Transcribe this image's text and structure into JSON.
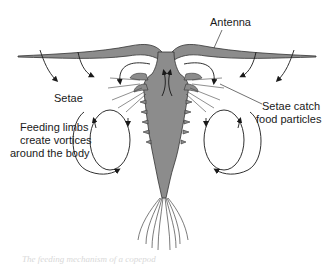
{
  "figure": {
    "labels": {
      "antenna": "Antenna",
      "setae": "Setae",
      "setae_catch": [
        "Setae catch",
        "food particles"
      ],
      "feeding_limbs": [
        "Feeding limbs",
        "create vortices",
        "around the body"
      ]
    },
    "bottom_caption_partial": "The feeding mechanism of a copepod",
    "colors": {
      "body_fill": "#8c8c8c",
      "outline": "#333333",
      "arrow": "#1a1a1a",
      "background": "#ffffff"
    }
  }
}
